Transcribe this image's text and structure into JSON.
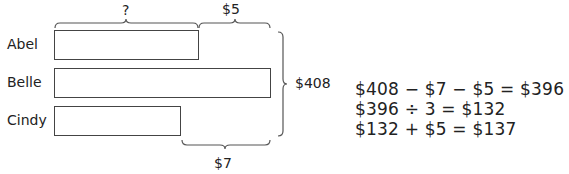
{
  "diagram": {
    "type": "bar-model",
    "rows": [
      {
        "name": "Abel",
        "label": "Abel"
      },
      {
        "name": "Belle",
        "label": "Belle"
      },
      {
        "name": "Cindy",
        "label": "Cindy"
      }
    ],
    "top_braces": {
      "unknown_label": "?",
      "difference_label": "$5"
    },
    "total_label": "$408",
    "bottom_brace_label": "$7"
  },
  "equations": [
    "$408 − $7 − $5 = $396",
    "$396 ÷ 3 = $132",
    "$132 + $5 = $137"
  ]
}
